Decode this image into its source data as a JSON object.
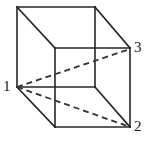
{
  "figure": {
    "kind": "geometry-diagram",
    "shape_name": "cube",
    "projection": "oblique parallel projection",
    "background_color": "#ffffff",
    "stroke_color": "#262626",
    "hidden_stroke_color": "#333333",
    "solid_stroke_width": 1.6,
    "dashed_stroke_width": 1.8,
    "dash_pattern": "6 4",
    "labels": [
      {
        "id": "label-1",
        "text": "1",
        "x": 3,
        "y": 79,
        "vertex_x": 17,
        "vertex_y": 87
      },
      {
        "id": "label-2",
        "text": "2",
        "x": 134,
        "y": 119,
        "vertex_x": 130,
        "vertex_y": 127
      },
      {
        "id": "label-3",
        "text": "3",
        "x": 134,
        "y": 40,
        "vertex_x": 130,
        "vertex_y": 49
      }
    ],
    "vertices": {
      "back_top_left": {
        "x": 17,
        "y": 7
      },
      "back_top_right": {
        "x": 95,
        "y": 7
      },
      "back_bottom_left": {
        "x": 17,
        "y": 87
      },
      "back_bottom_right": {
        "x": 95,
        "y": 87
      },
      "front_top_left": {
        "x": 55,
        "y": 48
      },
      "front_top_right": {
        "x": 130,
        "y": 48
      },
      "front_bottom_left": {
        "x": 55,
        "y": 127
      },
      "front_bottom_right": {
        "x": 130,
        "y": 127
      }
    },
    "solid_edges": [
      {
        "name": "back-top",
        "x1": 17,
        "y1": 7,
        "x2": 95,
        "y2": 7
      },
      {
        "name": "back-left",
        "x1": 17,
        "y1": 7,
        "x2": 17,
        "y2": 87
      },
      {
        "name": "back-right",
        "x1": 95,
        "y1": 7,
        "x2": 95,
        "y2": 87
      },
      {
        "name": "back-bottom",
        "x1": 17,
        "y1": 87,
        "x2": 95,
        "y2": 87
      },
      {
        "name": "front-top",
        "x1": 55,
        "y1": 48,
        "x2": 130,
        "y2": 48
      },
      {
        "name": "front-left",
        "x1": 55,
        "y1": 48,
        "x2": 55,
        "y2": 127
      },
      {
        "name": "front-right",
        "x1": 130,
        "y1": 48,
        "x2": 130,
        "y2": 127
      },
      {
        "name": "front-bottom",
        "x1": 55,
        "y1": 127,
        "x2": 130,
        "y2": 127
      },
      {
        "name": "connector-top-left",
        "x1": 17,
        "y1": 7,
        "x2": 55,
        "y2": 48
      },
      {
        "name": "connector-top-right",
        "x1": 95,
        "y1": 7,
        "x2": 130,
        "y2": 48
      },
      {
        "name": "connector-bottom-left",
        "x1": 17,
        "y1": 87,
        "x2": 55,
        "y2": 127
      },
      {
        "name": "connector-bottom-right",
        "x1": 95,
        "y1": 87,
        "x2": 130,
        "y2": 127
      }
    ],
    "dashed_edges": [
      {
        "name": "diagonal-1-to-3",
        "x1": 17,
        "y1": 87,
        "x2": 130,
        "y2": 49
      },
      {
        "name": "diagonal-1-to-2",
        "x1": 17,
        "y1": 87,
        "x2": 130,
        "y2": 127
      }
    ]
  }
}
